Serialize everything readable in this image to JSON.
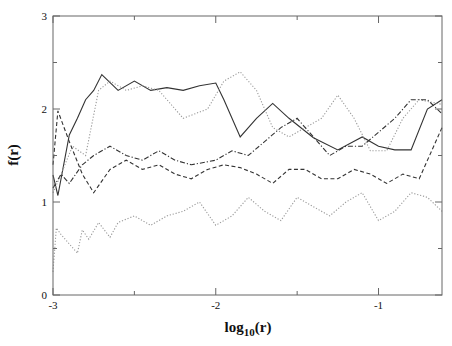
{
  "chart_data": {
    "type": "line",
    "title": "",
    "xlabel": "log10(r)",
    "ylabel": "f(r)",
    "xlim": [
      -3,
      -0.61
    ],
    "ylim": [
      0,
      3
    ],
    "x_ticks": [
      -3,
      -2,
      -1
    ],
    "x_tick_labels": [
      "-3",
      "-2",
      "-1"
    ],
    "y_ticks": [
      0,
      1,
      2,
      3
    ],
    "y_tick_labels": [
      "0",
      "1",
      "2",
      "3"
    ],
    "grid": false,
    "legend": null,
    "series": [
      {
        "name": "solid",
        "style": "solid",
        "color": "#333333",
        "x": [
          -3.0,
          -2.97,
          -2.9,
          -2.85,
          -2.8,
          -2.75,
          -2.7,
          -2.6,
          -2.5,
          -2.4,
          -2.3,
          -2.2,
          -2.1,
          -2.0,
          -1.95,
          -1.85,
          -1.75,
          -1.65,
          -1.55,
          -1.4,
          -1.25,
          -1.1,
          -1.0,
          -0.9,
          -0.8,
          -0.7,
          -0.61
        ],
        "y": [
          1.29,
          1.07,
          1.72,
          1.9,
          2.1,
          2.2,
          2.37,
          2.2,
          2.3,
          2.2,
          2.23,
          2.2,
          2.25,
          2.28,
          2.1,
          1.7,
          1.9,
          2.06,
          1.9,
          1.69,
          1.56,
          1.7,
          1.6,
          1.56,
          1.56,
          2.0,
          2.1
        ]
      },
      {
        "name": "dotted-upper",
        "style": "dotted",
        "color": "#999999",
        "x": [
          -3.0,
          -2.95,
          -2.88,
          -2.8,
          -2.72,
          -2.65,
          -2.55,
          -2.45,
          -2.35,
          -2.2,
          -2.05,
          -1.95,
          -1.85,
          -1.75,
          -1.65,
          -1.55,
          -1.45,
          -1.35,
          -1.25,
          -1.15,
          -1.05,
          -0.95,
          -0.85,
          -0.75,
          -0.61
        ],
        "y": [
          1.1,
          1.3,
          1.6,
          1.5,
          2.2,
          2.3,
          2.2,
          2.25,
          2.2,
          1.9,
          2.0,
          2.3,
          2.4,
          2.2,
          1.8,
          1.7,
          1.8,
          1.9,
          2.15,
          1.9,
          1.55,
          1.55,
          1.9,
          2.1,
          2.05
        ]
      },
      {
        "name": "dash-dot",
        "style": "dashdot",
        "color": "#333333",
        "x": [
          -3.0,
          -2.95,
          -2.9,
          -2.82,
          -2.75,
          -2.65,
          -2.55,
          -2.45,
          -2.35,
          -2.25,
          -2.15,
          -2.0,
          -1.9,
          -1.8,
          -1.7,
          -1.6,
          -1.5,
          -1.4,
          -1.3,
          -1.2,
          -1.1,
          -1.0,
          -0.9,
          -0.8,
          -0.7,
          -0.61
        ],
        "y": [
          1.15,
          1.3,
          1.2,
          1.4,
          1.5,
          1.6,
          1.5,
          1.45,
          1.55,
          1.45,
          1.4,
          1.45,
          1.55,
          1.5,
          1.65,
          1.8,
          1.9,
          1.7,
          1.5,
          1.6,
          1.6,
          1.75,
          1.9,
          2.1,
          2.1,
          1.95
        ]
      },
      {
        "name": "dashed",
        "style": "dashed",
        "color": "#333333",
        "x": [
          -3.0,
          -2.97,
          -2.9,
          -2.82,
          -2.75,
          -2.65,
          -2.55,
          -2.45,
          -2.35,
          -2.25,
          -2.15,
          -2.05,
          -1.95,
          -1.85,
          -1.75,
          -1.65,
          -1.55,
          -1.45,
          -1.35,
          -1.25,
          -1.15,
          -1.05,
          -0.95,
          -0.85,
          -0.75,
          -0.61
        ],
        "y": [
          1.4,
          1.98,
          1.65,
          1.3,
          1.1,
          1.35,
          1.45,
          1.35,
          1.4,
          1.3,
          1.25,
          1.35,
          1.4,
          1.37,
          1.3,
          1.2,
          1.35,
          1.35,
          1.25,
          1.25,
          1.35,
          1.3,
          1.2,
          1.3,
          1.25,
          1.8
        ]
      },
      {
        "name": "dotted-lower",
        "style": "dotted",
        "color": "#999999",
        "x": [
          -3.0,
          -2.98,
          -2.95,
          -2.85,
          -2.82,
          -2.78,
          -2.72,
          -2.65,
          -2.6,
          -2.5,
          -2.4,
          -2.3,
          -2.2,
          -2.1,
          -2.0,
          -1.9,
          -1.8,
          -1.7,
          -1.6,
          -1.5,
          -1.4,
          -1.3,
          -1.2,
          -1.1,
          -1.0,
          -0.9,
          -0.8,
          -0.7,
          -0.61
        ],
        "y": [
          0.25,
          0.72,
          0.65,
          0.45,
          0.7,
          0.6,
          0.78,
          0.62,
          0.78,
          0.85,
          0.75,
          0.85,
          0.9,
          1.0,
          0.75,
          0.85,
          1.05,
          0.9,
          0.8,
          1.05,
          0.95,
          0.85,
          1.0,
          1.1,
          0.8,
          0.9,
          1.1,
          1.05,
          0.9
        ]
      }
    ]
  }
}
